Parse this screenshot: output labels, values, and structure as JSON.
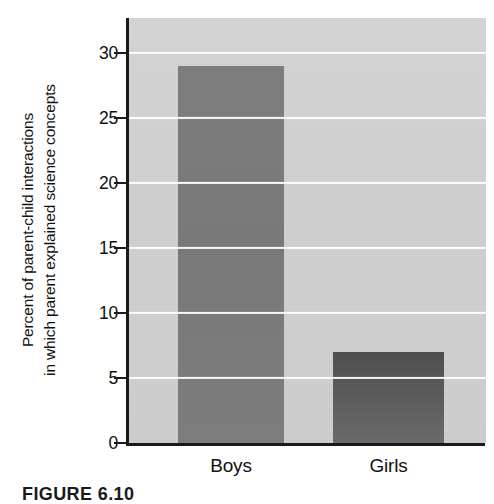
{
  "chart_data": {
    "type": "bar",
    "title": "",
    "categories": [
      "Boys",
      "Girls"
    ],
    "values": [
      29,
      7
    ],
    "series": [
      {
        "name": "Percent of parent-child interactions in which parent explained science concepts",
        "values": [
          29,
          7
        ]
      }
    ],
    "xlabel": "",
    "ylabel_line1": "Percent of parent-child interactions",
    "ylabel_line2": "in which parent explained science concepts",
    "ylim": [
      0,
      33
    ],
    "yticks": [
      0,
      5,
      10,
      15,
      20,
      25,
      30
    ],
    "ytick_labels": [
      "0",
      "5",
      "10",
      "15",
      "20",
      "25",
      "30"
    ],
    "grid": "horizontal",
    "legend": "none",
    "bar_colors": [
      "#7a7a7a",
      "#595959"
    ],
    "plot_background": "#d2d2d2",
    "gridline_color": "#ffffff",
    "axis_color": "#1a1a1a"
  },
  "caption": {
    "text": "FIGURE 6.10"
  }
}
